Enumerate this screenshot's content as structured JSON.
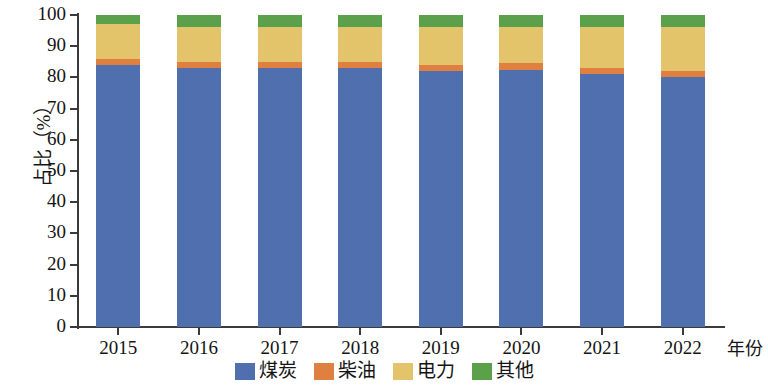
{
  "chart_data": {
    "type": "bar",
    "stacked": true,
    "title": "",
    "xlabel": "年份",
    "ylabel": "占比（%）",
    "categories": [
      "2015",
      "2016",
      "2017",
      "2018",
      "2019",
      "2020",
      "2021",
      "2022"
    ],
    "ylim": [
      0,
      100
    ],
    "yticks": [
      0,
      10,
      20,
      30,
      40,
      50,
      60,
      70,
      80,
      90,
      100
    ],
    "ytick_labels": [
      "0",
      "10",
      "20",
      "30",
      "40",
      "50",
      "60",
      "70",
      "80",
      "90",
      "100"
    ],
    "grid": false,
    "legend_position": "bottom-center",
    "series": [
      {
        "name": "煤炭",
        "color": "#4f6fae",
        "values": [
          84,
          83,
          83,
          83,
          82,
          82.5,
          81,
          80
        ]
      },
      {
        "name": "柴油",
        "color": "#e08040",
        "values": [
          2,
          2,
          2,
          2,
          2,
          2,
          2,
          2
        ]
      },
      {
        "name": "电力",
        "color": "#e3c46a",
        "values": [
          11,
          11,
          11,
          11,
          12,
          11.5,
          13,
          14
        ]
      },
      {
        "name": "其他",
        "color": "#5ba04a",
        "values": [
          3,
          4,
          4,
          4,
          4,
          4,
          4,
          4
        ]
      }
    ]
  },
  "axes": {
    "y_title": "占比（%）",
    "x_title": "年份"
  },
  "legend": {
    "items": [
      {
        "label": "煤炭",
        "color": "#4f6fae"
      },
      {
        "label": "柴油",
        "color": "#e08040"
      },
      {
        "label": "电力",
        "color": "#e3c46a"
      },
      {
        "label": "其他",
        "color": "#5ba04a"
      }
    ]
  }
}
